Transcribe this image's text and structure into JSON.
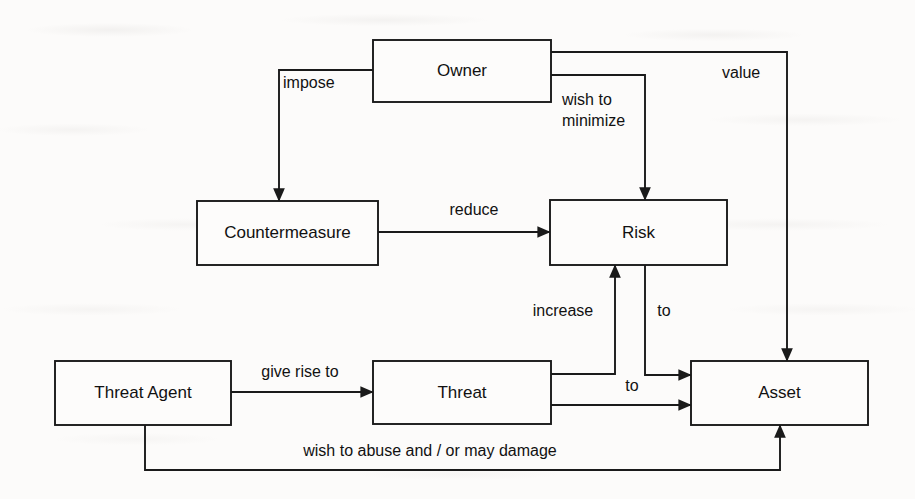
{
  "diagram": {
    "colors": {
      "background": "#fcfbfa",
      "stroke": "#1a1a1a",
      "box_fill": "#fdfcfb",
      "text": "#111111"
    },
    "nodes": [
      {
        "id": "owner",
        "label": "Owner",
        "x": 373,
        "y": 40,
        "w": 178,
        "h": 62
      },
      {
        "id": "countermeasure",
        "label": "Countermeasure",
        "x": 197,
        "y": 201,
        "w": 181,
        "h": 64
      },
      {
        "id": "risk",
        "label": "Risk",
        "x": 550,
        "y": 200,
        "w": 177,
        "h": 65
      },
      {
        "id": "threat-agent",
        "label": "Threat Agent",
        "x": 55,
        "y": 361,
        "w": 176,
        "h": 64
      },
      {
        "id": "threat",
        "label": "Threat",
        "x": 373,
        "y": 361,
        "w": 178,
        "h": 63
      },
      {
        "id": "asset",
        "label": "Asset",
        "x": 691,
        "y": 361,
        "w": 177,
        "h": 64
      }
    ],
    "edges": [
      {
        "id": "owner-imposes-countermeasure",
        "from": "owner",
        "to": "countermeasure",
        "label": "impose",
        "label_lines": [
          "impose"
        ],
        "label_x": 283,
        "label_y": 88,
        "label_anchor": "start",
        "path": "M 373 70 L 279 70 L 279 201",
        "arrowhead": "down"
      },
      {
        "id": "owner-wishes-to-minimize-risk",
        "from": "owner",
        "to": "risk",
        "label": "wish to minimize",
        "label_lines": [
          "wish to",
          "minimize"
        ],
        "label_x": 562,
        "label_y": 105,
        "label_anchor": "start",
        "path": "M 551 75 L 645 75 L 645 200",
        "arrowhead": "down"
      },
      {
        "id": "owner-values-asset",
        "from": "owner",
        "to": "asset",
        "label": "value",
        "label_lines": [
          "value"
        ],
        "label_x": 722,
        "label_y": 78,
        "label_anchor": "start",
        "path": "M 551 52 L 787 52 L 787 361",
        "arrowhead": "down"
      },
      {
        "id": "countermeasure-reduces-risk",
        "from": "countermeasure",
        "to": "risk",
        "label": "reduce",
        "label_lines": [
          "reduce"
        ],
        "label_x": 474,
        "label_y": 215,
        "label_anchor": "middle",
        "path": "M 378 232 L 550 232",
        "arrowhead": "right"
      },
      {
        "id": "threat-increases-risk",
        "from": "threat",
        "to": "risk",
        "label": "increase",
        "label_lines": [
          "increase"
        ],
        "label_x": 563,
        "label_y": 316,
        "label_anchor": "middle",
        "path": "M 551 374 L 615 374 L 615 265",
        "arrowhead": "up"
      },
      {
        "id": "risk-to-asset",
        "from": "risk",
        "to": "asset",
        "label": "to",
        "label_lines": [
          "to"
        ],
        "label_x": 664,
        "label_y": 316,
        "label_anchor": "middle",
        "path": "M 645 265 L 645 375 L 691 375",
        "arrowhead": "right"
      },
      {
        "id": "threat-agent-gives-rise-to-threat",
        "from": "threat-agent",
        "to": "threat",
        "label": "give rise to",
        "label_lines": [
          "give rise to"
        ],
        "label_x": 300,
        "label_y": 377,
        "label_anchor": "middle",
        "path": "M 231 392 L 373 392",
        "arrowhead": "right"
      },
      {
        "id": "threat-to-asset",
        "from": "threat",
        "to": "asset",
        "label": "to",
        "label_lines": [
          "to"
        ],
        "label_x": 632,
        "label_y": 391,
        "label_anchor": "middle",
        "path": "M 551 405 L 691 405",
        "arrowhead": "right"
      },
      {
        "id": "threat-agent-abuses-asset",
        "from": "threat-agent",
        "to": "asset",
        "label": "wish to abuse and / or may damage",
        "label_lines": [
          "wish to abuse and / or may damage"
        ],
        "label_x": 430,
        "label_y": 456,
        "label_anchor": "middle",
        "path": "M 145 425 L 145 470 L 780 470 L 780 425",
        "arrowhead": "up"
      }
    ]
  }
}
